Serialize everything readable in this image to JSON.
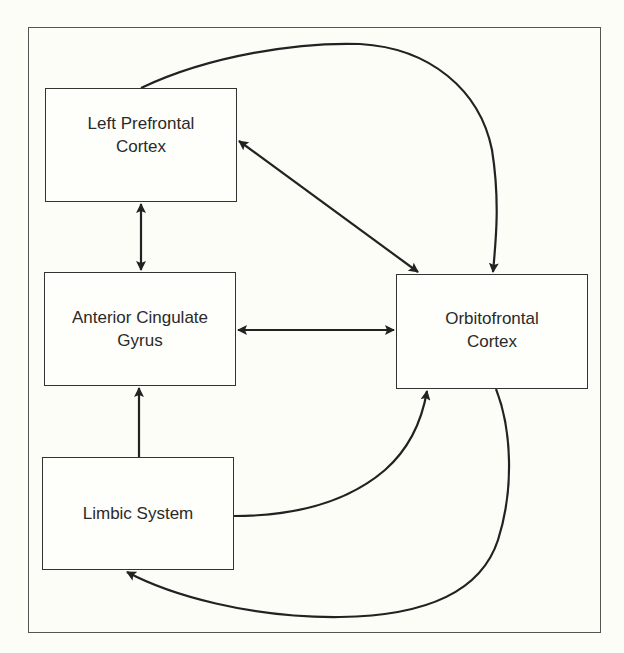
{
  "diagram": {
    "nodes": [
      {
        "id": "lpfc",
        "line1": "Left Prefrontal",
        "line2": "Cortex"
      },
      {
        "id": "acg",
        "line1": "Anterior Cingulate",
        "line2": "Gyrus"
      },
      {
        "id": "limbic",
        "line1": "Limbic System",
        "line2": ""
      },
      {
        "id": "ofc",
        "line1": "Orbitofrontal",
        "line2": "Cortex"
      }
    ],
    "edges": [
      {
        "from": "lpfc",
        "to": "acg",
        "direction": "bidirectional",
        "shape": "straight"
      },
      {
        "from": "acg",
        "to": "ofc",
        "direction": "bidirectional",
        "shape": "straight"
      },
      {
        "from": "lpfc",
        "to": "ofc",
        "direction": "bidirectional",
        "shape": "straight-diagonal"
      },
      {
        "from": "lpfc",
        "to": "ofc",
        "direction": "forward",
        "shape": "curved-top"
      },
      {
        "from": "limbic",
        "to": "acg",
        "direction": "forward",
        "shape": "straight"
      },
      {
        "from": "limbic",
        "to": "ofc",
        "direction": "forward",
        "shape": "curved"
      },
      {
        "from": "ofc",
        "to": "limbic",
        "direction": "forward",
        "shape": "curved-bottom"
      }
    ],
    "colors": {
      "background": "#fdfdf8",
      "stroke": "#222222",
      "text": "#2a2a2a"
    }
  }
}
